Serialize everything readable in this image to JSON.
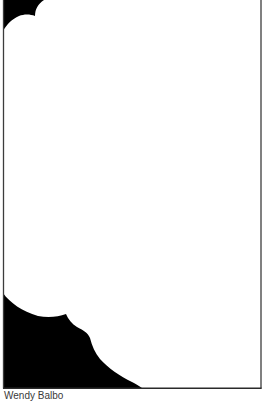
{
  "artwork": {
    "caption": "Wendy Balbo",
    "colors": {
      "background": "#ffffff",
      "fill": "#000000",
      "frame": "#3c3c3c",
      "caption": "#3a3a3a"
    }
  }
}
